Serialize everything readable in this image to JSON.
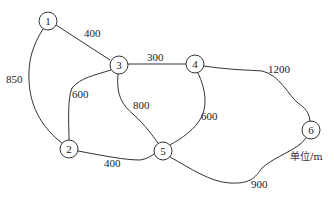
{
  "diagram": {
    "type": "weighted-undirected-graph",
    "unit_label": "单位/m",
    "nodes": [
      {
        "id": "1",
        "label": "1",
        "x": 48,
        "y": 21
      },
      {
        "id": "2",
        "label": "2",
        "x": 69,
        "y": 149
      },
      {
        "id": "3",
        "label": "3",
        "x": 119,
        "y": 65
      },
      {
        "id": "4",
        "label": "4",
        "x": 195,
        "y": 64
      },
      {
        "id": "5",
        "label": "5",
        "x": 163,
        "y": 151
      },
      {
        "id": "6",
        "label": "6",
        "x": 311,
        "y": 130
      }
    ],
    "edges": [
      {
        "from": "1",
        "to": "3",
        "weight": "400"
      },
      {
        "from": "1",
        "to": "2",
        "weight": "850"
      },
      {
        "from": "3",
        "to": "4",
        "weight": "300"
      },
      {
        "from": "3",
        "to": "2",
        "weight": "600"
      },
      {
        "from": "3",
        "to": "5",
        "weight": "800"
      },
      {
        "from": "4",
        "to": "5",
        "weight": "600"
      },
      {
        "from": "4",
        "to": "6",
        "weight": "1200"
      },
      {
        "from": "2",
        "to": "5",
        "weight": "400"
      },
      {
        "from": "5",
        "to": "6",
        "weight": "900"
      }
    ]
  }
}
